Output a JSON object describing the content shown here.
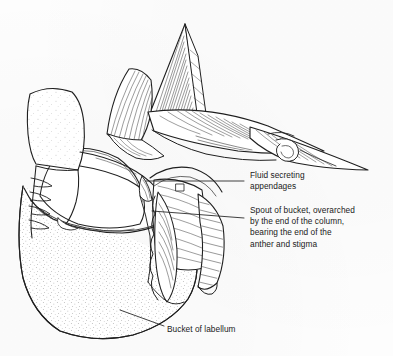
{
  "figure": {
    "background_color": "#fdfdfd",
    "ink_color": "#1a1a1a",
    "line_color": "#222222"
  },
  "labels": [
    {
      "id": "fluid",
      "name": "fluid-secreting-appendages-label",
      "lines": [
        "Fluid secreting",
        "appendages"
      ],
      "text": "Fluid secreting\nappendages"
    },
    {
      "id": "spout",
      "name": "spout-of-bucket-label",
      "lines": [
        "Spout of bucket, overarched",
        "by the end of the column,",
        "bearing the end of the",
        "anther and stigma"
      ],
      "text": "Spout of bucket, overarched\nby the end of the column,\nbearing the end of the\nanther and stigma"
    },
    {
      "id": "bucket",
      "name": "bucket-of-labellum-label",
      "lines": [
        "Bucket of labellum"
      ],
      "text": "Bucket of labellum"
    }
  ],
  "parts": [
    {
      "name": "sepal-dorsal-spike",
      "description": "tall pointed hatched sepal at top"
    },
    {
      "name": "petal-left",
      "description": "fan-hatched lateral petal upper left"
    },
    {
      "name": "sepal-lateral-right",
      "description": "long pointed spur extending to the right"
    },
    {
      "name": "column",
      "description": "central column arching over the spout"
    },
    {
      "name": "bucket-labellum",
      "description": "large stippled bucket at lower left"
    },
    {
      "name": "appendage-stalk",
      "description": "stalked gland with serrations at left"
    },
    {
      "name": "spout",
      "description": "tapering hatched spout below column"
    }
  ]
}
